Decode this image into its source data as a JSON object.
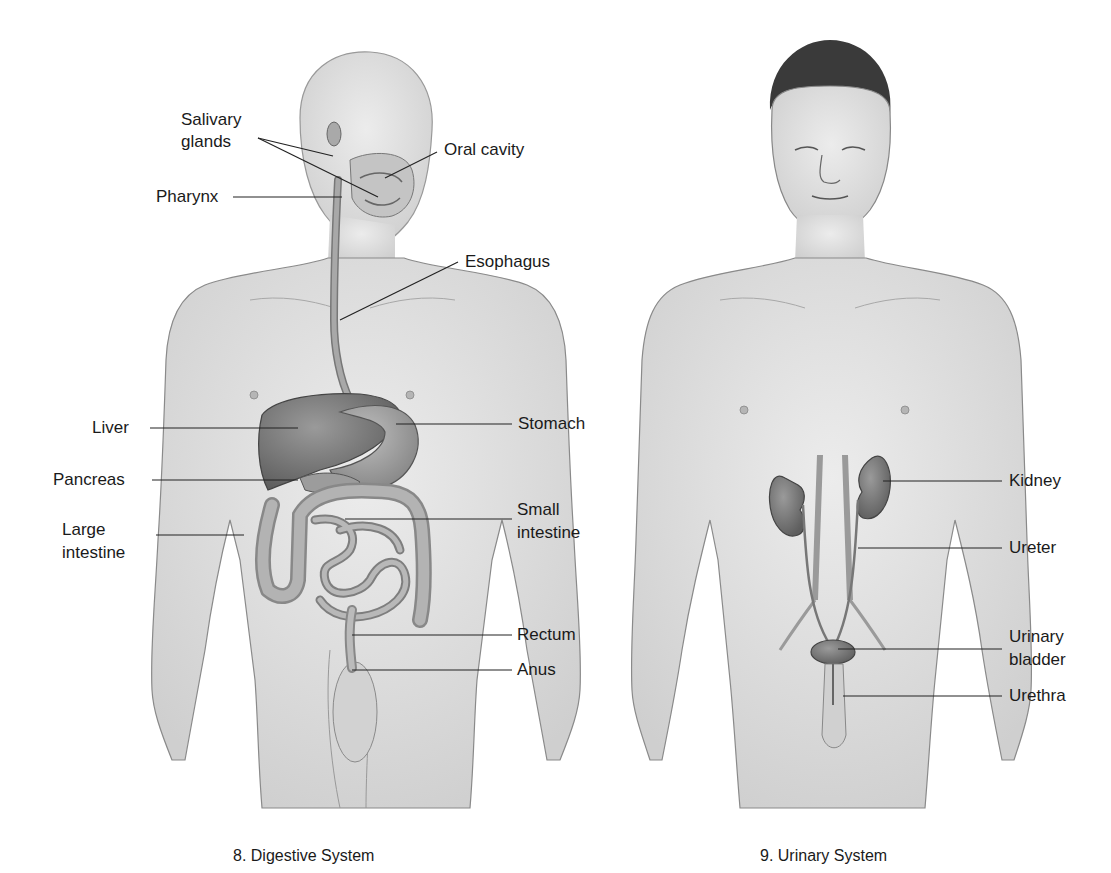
{
  "figures": [
    {
      "number": "8",
      "caption": "8. Digestive System",
      "labels": {
        "salivary_glands_1": "Salivary",
        "salivary_glands_2": "glands",
        "oral_cavity": "Oral cavity",
        "pharynx": "Pharynx",
        "esophagus": "Esophagus",
        "liver": "Liver",
        "stomach": "Stomach",
        "pancreas": "Pancreas",
        "small_intestine_1": "Small",
        "small_intestine_2": "intestine",
        "large_intestine_1": "Large",
        "large_intestine_2": "intestine",
        "rectum": "Rectum",
        "anus": "Anus"
      }
    },
    {
      "number": "9",
      "caption": "9. Urinary System",
      "labels": {
        "kidney": "Kidney",
        "ureter": "Ureter",
        "urinary_bladder_1": "Urinary",
        "urinary_bladder_2": "bladder",
        "urethra": "Urethra"
      }
    }
  ],
  "colors": {
    "skin": "#e2e2e2",
    "organ_dark": "#7a7a7a",
    "organ_mid": "#a6a6a6",
    "outline": "#555555",
    "leader_line": "#222222"
  }
}
